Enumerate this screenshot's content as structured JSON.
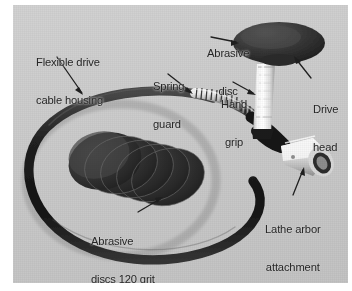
{
  "figure": {
    "kind": "annotated-photograph",
    "background_color": "#cbcbcb",
    "page_color": "#ffffff",
    "label_color": "#262626"
  },
  "labels": [
    {
      "id": "flexible-drive-cable-housing",
      "lines": [
        "Flexible drive",
        "cable housing"
      ],
      "line1": "Flexible drive",
      "line2": "cable housing",
      "points_to": "black flexible cable loop",
      "arrow": "down-right"
    },
    {
      "id": "spring-guard",
      "lines": [
        "Spring",
        "guard"
      ],
      "line1": "Spring",
      "line2": "guard",
      "points_to": "coiled metal spring sheath",
      "arrow": "down-right"
    },
    {
      "id": "abrasive-disc",
      "lines": [
        "Abrasive",
        "disc"
      ],
      "line1": "Abrasive",
      "line2": "disc",
      "points_to": "dark disc mounted on drive head",
      "arrow": "right"
    },
    {
      "id": "hand-grip",
      "lines": [
        "Hand",
        "grip"
      ],
      "line1": "Hand",
      "line2": "grip",
      "points_to": "white cylindrical handle",
      "arrow": "right-down"
    },
    {
      "id": "drive-head",
      "lines": [
        "Drive",
        "head"
      ],
      "line1": "Drive",
      "line2": "head",
      "points_to": "head assembly above hand grip",
      "arrow": "up-left"
    },
    {
      "id": "lathe-arbor-attachment-coupling",
      "lines": [
        "Lathe arbor",
        "attachment",
        "coupling"
      ],
      "line1": "Lathe arbor",
      "line2": "attachment",
      "line3": "coupling",
      "points_to": "chrome coupling sleeve",
      "arrow": "up-right"
    },
    {
      "id": "abrasive-discs-120-grit",
      "lines": [
        "Abrasive",
        "discs 120 grit"
      ],
      "line1": "Abrasive",
      "line2": "discs 120 grit",
      "grit": "120",
      "points_to": "fanned stack of abrasive discs",
      "arrow": "up-right"
    }
  ],
  "parts": {
    "cable_loop": {
      "name": "flexible drive cable housing",
      "color": "#1d1d1d"
    },
    "spring_guard": {
      "name": "spring guard",
      "color": "#8e8e8e"
    },
    "hand_grip": {
      "name": "hand grip",
      "color": "#efefef"
    },
    "drive_head_disc": {
      "name": "abrasive disc",
      "color": "#333333"
    },
    "coupling": {
      "name": "lathe arbor attachment coupling",
      "color": "#e4e4e4"
    },
    "disc_stack": {
      "name": "abrasive discs 120 grit",
      "count": 5,
      "color": "#3b3b3b"
    }
  }
}
